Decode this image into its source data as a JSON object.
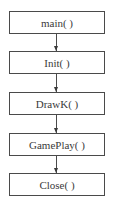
{
  "diagram": {
    "type": "flowchart",
    "direction": "top-to-bottom",
    "nodes": [
      {
        "id": "main",
        "label": "main( )"
      },
      {
        "id": "init",
        "label": "Init( )"
      },
      {
        "id": "drawk",
        "label": "DrawK( )"
      },
      {
        "id": "gameplay",
        "label": "GamePlay( )"
      },
      {
        "id": "close",
        "label": "Close( )"
      }
    ],
    "edges": [
      {
        "from": "main",
        "to": "init"
      },
      {
        "from": "init",
        "to": "drawk"
      },
      {
        "from": "drawk",
        "to": "gameplay"
      },
      {
        "from": "gameplay",
        "to": "close"
      }
    ],
    "colors": {
      "border": "#4a4a4a",
      "text": "#3a3a3a",
      "background": "#ffffff"
    }
  }
}
